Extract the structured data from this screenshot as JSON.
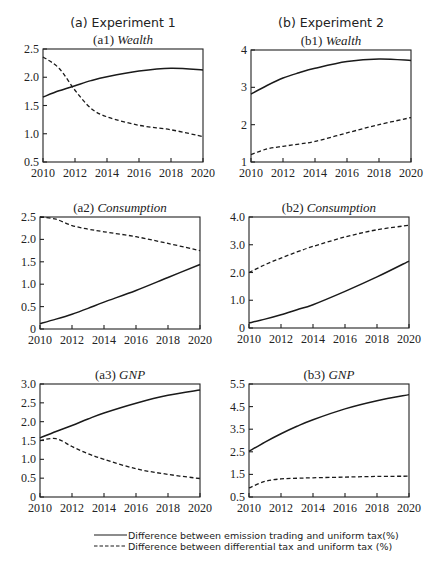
{
  "figure": {
    "columns": [
      {
        "id": "a",
        "title": "(a) Experiment 1"
      },
      {
        "id": "b",
        "title": "(b) Experiment 2"
      }
    ],
    "legend": [
      {
        "style": "solid",
        "label": "Difference between emission trading and uniform tax(%)"
      },
      {
        "style": "dashed",
        "label": "Difference between differential tax and uniform tax (%)"
      }
    ]
  },
  "chart_data": [
    {
      "id": "a1",
      "type": "line",
      "title_prefix": "(a1)",
      "title": "Wealth",
      "xlabel": "",
      "ylabel": "",
      "x": [
        2010,
        2011,
        2012,
        2013,
        2014,
        2016,
        2018,
        2020
      ],
      "xticks": [
        "2010",
        "2012",
        "2014",
        "2016",
        "2018",
        "2020"
      ],
      "ylim": [
        0.5,
        2.5
      ],
      "yticks": [
        "0.5",
        "1.0",
        "1.5",
        "2.0",
        "2.5"
      ],
      "series": [
        {
          "name": "Difference between emission trading and uniform tax(%)",
          "style": "solid",
          "values": [
            1.65,
            1.76,
            1.85,
            1.94,
            2.01,
            2.11,
            2.16,
            2.13
          ]
        },
        {
          "name": "Difference between differential tax and uniform tax (%)",
          "style": "dashed",
          "values": [
            2.36,
            2.16,
            1.77,
            1.45,
            1.3,
            1.15,
            1.07,
            0.95
          ]
        }
      ]
    },
    {
      "id": "b1",
      "type": "line",
      "title_prefix": "(b1)",
      "title": "Wealth",
      "xlabel": "",
      "ylabel": "",
      "x": [
        2010,
        2011,
        2012,
        2013,
        2014,
        2016,
        2018,
        2020
      ],
      "xticks": [
        "2010",
        "2012",
        "2014",
        "2016",
        "2018",
        "2020"
      ],
      "ylim": [
        1,
        4
      ],
      "yticks": [
        "1",
        "2",
        "3",
        "4"
      ],
      "series": [
        {
          "name": "Difference between emission trading and uniform tax(%)",
          "style": "solid",
          "values": [
            2.82,
            3.05,
            3.25,
            3.39,
            3.51,
            3.69,
            3.76,
            3.72
          ]
        },
        {
          "name": "Difference between differential tax and uniform tax (%)",
          "style": "dashed",
          "values": [
            1.2,
            1.35,
            1.42,
            1.48,
            1.55,
            1.78,
            2.0,
            2.19
          ]
        }
      ]
    },
    {
      "id": "a2",
      "type": "line",
      "title_prefix": "(a2)",
      "title": "Consumption",
      "xlabel": "",
      "ylabel": "",
      "x": [
        2010,
        2011,
        2012,
        2013,
        2014,
        2016,
        2018,
        2020
      ],
      "xticks": [
        "2010",
        "2012",
        "2014",
        "2016",
        "2018",
        "2020"
      ],
      "ylim": [
        0,
        2.5
      ],
      "yticks": [
        "0",
        "0.5",
        "1.0",
        "1.5",
        "2.0",
        "2.5"
      ],
      "series": [
        {
          "name": "Difference between emission trading and uniform tax(%)",
          "style": "solid",
          "values": [
            0.12,
            0.22,
            0.33,
            0.46,
            0.6,
            0.86,
            1.15,
            1.44
          ]
        },
        {
          "name": "Difference between differential tax and uniform tax (%)",
          "style": "dashed",
          "values": [
            2.5,
            2.45,
            2.31,
            2.23,
            2.17,
            2.06,
            1.91,
            1.75
          ]
        }
      ]
    },
    {
      "id": "b2",
      "type": "line",
      "title_prefix": "(b2)",
      "title": "Consumption",
      "xlabel": "",
      "ylabel": "",
      "x": [
        2010,
        2011,
        2012,
        2013,
        2014,
        2016,
        2018,
        2020
      ],
      "xticks": [
        "2010",
        "2012",
        "2014",
        "2016",
        "2018",
        "2020"
      ],
      "ylim": [
        0,
        4.0
      ],
      "yticks": [
        "0",
        "1.0",
        "2.0",
        "3.0",
        "4.0"
      ],
      "series": [
        {
          "name": "Difference between emission trading and uniform tax(%)",
          "style": "solid",
          "values": [
            0.18,
            0.32,
            0.48,
            0.66,
            0.84,
            1.32,
            1.84,
            2.41
          ]
        },
        {
          "name": "Difference between differential tax and uniform tax (%)",
          "style": "dashed",
          "values": [
            2.0,
            2.28,
            2.52,
            2.74,
            2.94,
            3.28,
            3.54,
            3.7
          ]
        }
      ]
    },
    {
      "id": "a3",
      "type": "line",
      "title_prefix": "(a3)",
      "title": "GNP",
      "xlabel": "",
      "ylabel": "",
      "x": [
        2010,
        2011,
        2012,
        2013,
        2014,
        2016,
        2018,
        2020
      ],
      "xticks": [
        "2010",
        "2012",
        "2014",
        "2016",
        "2018",
        "2020"
      ],
      "ylim": [
        0,
        3.0
      ],
      "yticks": [
        "0",
        "0.5",
        "1.0",
        "1.5",
        "2.0",
        "2.5",
        "3.0"
      ],
      "series": [
        {
          "name": "Difference between emission trading and uniform tax(%)",
          "style": "solid",
          "values": [
            1.57,
            1.74,
            1.9,
            2.07,
            2.23,
            2.49,
            2.7,
            2.84
          ]
        },
        {
          "name": "Difference between differential tax and uniform tax (%)",
          "style": "dashed",
          "values": [
            1.5,
            1.55,
            1.34,
            1.15,
            1.0,
            0.75,
            0.6,
            0.49
          ]
        }
      ]
    },
    {
      "id": "b3",
      "type": "line",
      "title_prefix": "(b3)",
      "title": "GNP",
      "xlabel": "",
      "ylabel": "",
      "x": [
        2010,
        2011,
        2012,
        2013,
        2014,
        2016,
        2018,
        2020
      ],
      "xticks": [
        "2010",
        "2012",
        "2014",
        "2016",
        "2018",
        "2020"
      ],
      "ylim": [
        0.5,
        5.5
      ],
      "yticks": [
        "0.5",
        "1.5",
        "2.5",
        "3.5",
        "4.5",
        "5.5"
      ],
      "series": [
        {
          "name": "Difference between emission trading and uniform tax(%)",
          "style": "solid",
          "values": [
            2.52,
            2.93,
            3.3,
            3.63,
            3.92,
            4.4,
            4.76,
            5.03
          ]
        },
        {
          "name": "Difference between differential tax and uniform tax (%)",
          "style": "dashed",
          "values": [
            0.9,
            1.19,
            1.3,
            1.33,
            1.35,
            1.38,
            1.41,
            1.42
          ]
        }
      ]
    }
  ]
}
